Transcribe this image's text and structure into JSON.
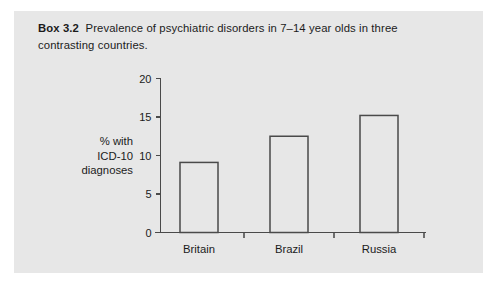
{
  "figure": {
    "box_label": "Box 3.2",
    "caption": "Prevalence of psychiatric disorders in 7–14 year olds in three contrasting countries.",
    "panel_color": "#e7e7e7",
    "page_color": "#ffffff",
    "ink_color": "#1b1b1b"
  },
  "chart_data": {
    "type": "bar",
    "title": "Prevalence of psychiatric disorders in 7–14 year olds in three contrasting countries.",
    "categories": [
      "Britain",
      "Brazil",
      "Russia"
    ],
    "values": [
      9.1,
      12.5,
      15.2
    ],
    "xlabel": "",
    "ylabel": "% with ICD-10 diagnoses",
    "ylabel_lines": [
      "% with",
      "ICD-10",
      "diagnoses"
    ],
    "ylim": [
      0,
      20
    ],
    "yticks": [
      0,
      5,
      10,
      15,
      20
    ],
    "ytick_labels": [
      "0",
      "5",
      "10",
      "15",
      "20"
    ],
    "grid": false,
    "legend": false,
    "bar_fill": "#e7e7e7",
    "bar_stroke": "#4a4a4a",
    "axis_color": "#4a4a4a"
  }
}
